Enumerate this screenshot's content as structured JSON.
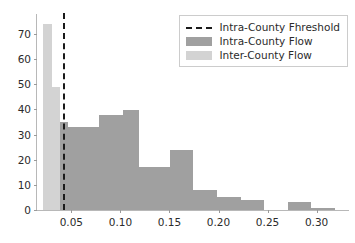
{
  "chart_data": {
    "type": "bar",
    "title": "",
    "xlabel": "",
    "ylabel": "",
    "xlim": [
      0.015,
      0.333
    ],
    "ylim": [
      0,
      78
    ],
    "grid": false,
    "legend_position": "upper right",
    "xticks": [
      0.05,
      0.1,
      0.15,
      0.2,
      0.25,
      0.3
    ],
    "xtick_labels": [
      "0.05",
      "0.10",
      "0.15",
      "0.20",
      "0.25",
      "0.30"
    ],
    "yticks": [
      0,
      10,
      20,
      30,
      40,
      50,
      60,
      70
    ],
    "ytick_labels": [
      "0",
      "10",
      "20",
      "30",
      "40",
      "50",
      "60",
      "70"
    ],
    "annotations": [
      {
        "name": "intra-county-threshold",
        "type": "vline",
        "x": 0.042,
        "style": "dashed",
        "color": "#1a1a1a"
      }
    ],
    "series": [
      {
        "name": "Inter-County Flow",
        "color": "#d3d3d3",
        "bin_edges": [
          0.0215,
          0.0305,
          0.0385,
          0.0465
        ],
        "values": [
          74,
          49,
          35
        ]
      },
      {
        "name": "Intra-County Flow",
        "color": "#a0a0a0",
        "bin_edges": [
          0.0385,
          0.0465,
          0.0545,
          0.0625,
          0.0705,
          0.0785,
          0.0865,
          0.0945,
          0.1025,
          0.1105,
          0.1185,
          0.1265,
          0.1345,
          0.1425,
          0.1505,
          0.1585,
          0.1665,
          0.1745,
          0.1825,
          0.1905,
          0.1985,
          0.2065,
          0.2145,
          0.2225,
          0.2305,
          0.2385,
          0.2465,
          0.2705,
          0.2785,
          0.2865,
          0.2945,
          0.3025,
          0.3105,
          0.3185
        ],
        "values": [
          35,
          33,
          33,
          33,
          33,
          38,
          38,
          38,
          40,
          40,
          17,
          17,
          17,
          17,
          24,
          24,
          24,
          8,
          8,
          8,
          5,
          5,
          5,
          4,
          4,
          4,
          0,
          3,
          3,
          3,
          1,
          1,
          1
        ]
      }
    ]
  },
  "legend": {
    "items": [
      {
        "label": "Intra-County Fhreshold",
        "key": "dashed"
      },
      {
        "label": "Intra-County Flow",
        "key": "intra"
      },
      {
        "label": "Inter-County Flow",
        "key": "inter"
      }
    ]
  }
}
